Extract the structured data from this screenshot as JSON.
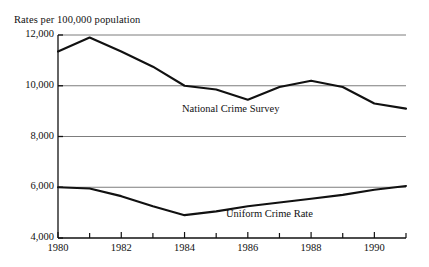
{
  "chart_data": {
    "type": "line",
    "title": "Rates per 100,000 population",
    "xlabel": "",
    "ylabel": "",
    "xlim": [
      1980,
      1991
    ],
    "ylim": [
      4000,
      12000
    ],
    "grid": true,
    "legend_position": "inline-annotation",
    "ytick_labels": [
      "12,000",
      "10,000",
      "8,000",
      "6,000",
      "4,000"
    ],
    "ytick_values": [
      12000,
      10000,
      8000,
      6000,
      4000
    ],
    "xtick_labels": [
      "1980",
      "1982",
      "1984",
      "1986",
      "1988",
      "1990"
    ],
    "xtick_values": [
      1980,
      1982,
      1984,
      1986,
      1988,
      1990
    ],
    "xtick_minor_values": [
      1981,
      1983,
      1985,
      1987,
      1989,
      1991
    ],
    "x": [
      1980,
      1981,
      1982,
      1983,
      1984,
      1985,
      1986,
      1987,
      1988,
      1989,
      1990,
      1991
    ],
    "series": [
      {
        "name": "National Crime Survey",
        "color": "#111111",
        "annotation": "National Crime Survey",
        "values": [
          11350,
          11900,
          11350,
          10750,
          10000,
          9850,
          9450,
          9950,
          10200,
          9950,
          9300,
          9100
        ]
      },
      {
        "name": "Uniform Crime Rate",
        "color": "#111111",
        "annotation": "Uniform Crime Rate",
        "values": [
          6000,
          5950,
          5650,
          5250,
          4900,
          5050,
          5250,
          5400,
          5550,
          5700,
          5900,
          6050
        ]
      }
    ]
  },
  "geometry": {
    "plot_left": 58,
    "plot_right": 406,
    "plot_top": 35,
    "plot_bottom": 238,
    "annotation_ncs": {
      "x": 182,
      "y": 103
    },
    "annotation_ucr": {
      "x": 226,
      "y": 208
    }
  },
  "colors": {
    "axis": "#111111",
    "gridline": "#7d7d7d",
    "line": "#111111",
    "background": "#ffffff"
  }
}
